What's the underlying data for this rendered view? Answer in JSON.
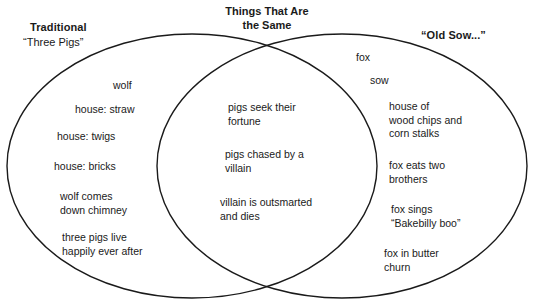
{
  "diagram": {
    "type": "venn",
    "background_color": "#ffffff",
    "stroke_color": "#1a1a1a",
    "text_color": "#1a1a1a",
    "center_title": "Things That Are\nthe Same",
    "left_heading_bold": "Traditional",
    "left_heading_sub": "“Three Pigs”",
    "right_heading_bold": "“Old Sow...”"
  },
  "left_items": [
    {
      "text": "wolf",
      "x": 113,
      "y": 79
    },
    {
      "text": "house: straw",
      "x": 75,
      "y": 103
    },
    {
      "text": "house: twigs",
      "x": 57,
      "y": 130
    },
    {
      "text": "house: bricks",
      "x": 54,
      "y": 160
    },
    {
      "text": "wolf comes\ndown chimney",
      "x": 60,
      "y": 190
    },
    {
      "text": "three pigs live\nhappily ever after",
      "x": 62,
      "y": 231
    }
  ],
  "center_items": [
    {
      "text": "pigs seek their\nfortune",
      "x": 228,
      "y": 101
    },
    {
      "text": "pigs chased by a\nvillain",
      "x": 225,
      "y": 148
    },
    {
      "text": "villain is outsmarted\nand dies",
      "x": 220,
      "y": 196
    }
  ],
  "right_items": [
    {
      "text": "fox",
      "x": 356,
      "y": 51
    },
    {
      "text": "sow",
      "x": 370,
      "y": 74
    },
    {
      "text": "house of\nwood chips and\ncorn stalks",
      "x": 389,
      "y": 100
    },
    {
      "text": "fox eats two\nbrothers",
      "x": 389,
      "y": 159
    },
    {
      "text": "fox sings\n“Bakebilly boo”",
      "x": 391,
      "y": 203
    },
    {
      "text": "fox in butter\nchurn",
      "x": 384,
      "y": 247
    }
  ]
}
